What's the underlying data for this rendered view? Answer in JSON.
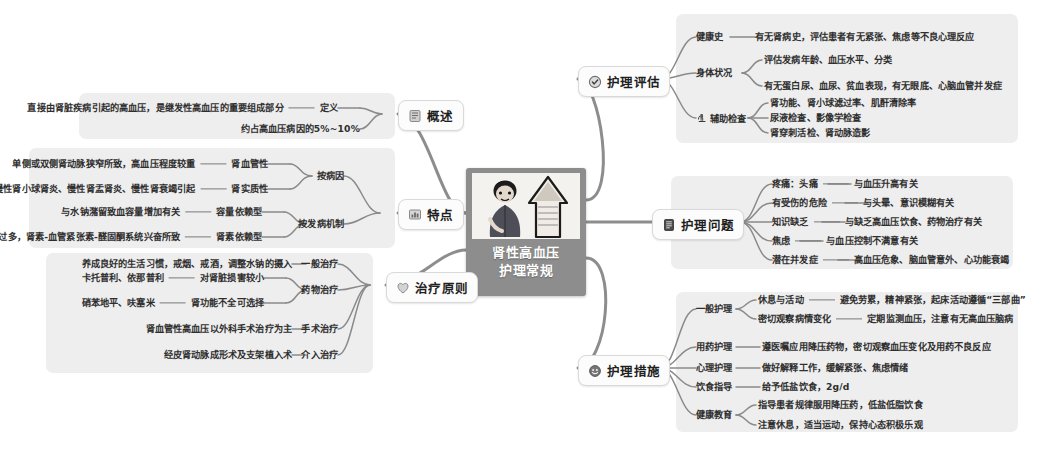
{
  "meta": {
    "root_title_line1": "肾性高血压",
    "root_title_line2": "护理常规",
    "bg_color": "#ffffff",
    "panel_color": "#eeeeee",
    "root_color": "#8d8d8d"
  },
  "branches": {
    "gaishu": {
      "label": "概述",
      "icon": "book-icon",
      "items": [
        {
          "key": "定义",
          "detail": "直接由肾脏疾病引起的高血压，是继发性高血压的重要组成部分"
        },
        {
          "key": "约占高血压病因的5%~10%",
          "detail": ""
        }
      ]
    },
    "tedian": {
      "label": "特点",
      "icon": "chart-icon",
      "groups": [
        {
          "key": "按病因",
          "items": [
            {
              "key": "肾血管性",
              "detail": "单侧或双侧肾动脉狭窄所致，高血压程度较重"
            },
            {
              "key": "肾实质性",
              "detail": "急性或慢性肾小球肾炎、慢性肾盂肾炎、慢性肾衰竭引起"
            }
          ]
        },
        {
          "key": "按发病机制",
          "items": [
            {
              "key": "容量依赖型",
              "detail": "与水钠潴留致血容量增加有关"
            },
            {
              "key": "肾素依赖型",
              "detail": "肾素分泌过多，肾素-血管紧张素-醛固酮系统兴奋所致"
            }
          ]
        }
      ]
    },
    "zhiliao": {
      "label": "治疗原则",
      "icon": "heart-icon",
      "groups": [
        {
          "key": "一般治疗",
          "items": [
            {
              "key": "",
              "detail": "养成良好的生活习惯，戒烟、戒酒，调整水钠的摄入"
            }
          ]
        },
        {
          "key": "药物治疗",
          "items": [
            {
              "key": "卡托普利、依那普利",
              "detail": "对肾脏损害较小"
            },
            {
              "key": "硝苯地平、呋塞米",
              "detail": "肾功能不全可选择"
            }
          ]
        },
        {
          "key": "手术治疗",
          "items": [
            {
              "key": "",
              "detail": "肾血管性高血压以外科手术治疗为主"
            }
          ]
        },
        {
          "key": "介入治疗",
          "items": [
            {
              "key": "",
              "detail": "经皮肾动脉成形术及支架植入术"
            }
          ]
        }
      ]
    },
    "pinggu": {
      "label": "护理评估",
      "icon": "check-circle-icon",
      "groups": [
        {
          "key": "健康史",
          "icon": "",
          "items": [
            {
              "detail": "有无肾病史，评估患者有无紧张、焦虑等不良心理反应"
            }
          ]
        },
        {
          "key": "身体状况",
          "icon": "",
          "items": [
            {
              "detail": "评估发病年龄、血压水平、分类"
            },
            {
              "detail": "有无蛋白尿、血尿、贫血表现，有无眼底、心脑血管并发症"
            }
          ]
        },
        {
          "key": "辅助检查",
          "icon": "microscope-icon",
          "items": [
            {
              "detail": "肾功能、肾小球滤过率、肌酐清除率"
            },
            {
              "detail": "尿液检查、影像学检查"
            },
            {
              "detail": "肾穿刺活检、肾动脉造影"
            }
          ]
        }
      ]
    },
    "wenti": {
      "label": "护理问题",
      "icon": "clipboard-icon",
      "items": [
        {
          "key": "疼痛：头痛",
          "detail": "与血压升高有关"
        },
        {
          "key": "有受伤的危险",
          "detail": "与头晕、意识模糊有关"
        },
        {
          "key": "知识缺乏",
          "detail": "与缺乏高血压饮食、药物治疗有关"
        },
        {
          "key": "焦虑",
          "detail": "与血压控制不满意有关"
        },
        {
          "key": "潜在并发症",
          "detail": "高血压危象、脑血管意外、心功能衰竭"
        }
      ]
    },
    "cuoshi": {
      "label": "护理措施",
      "icon": "smiley-icon",
      "groups": [
        {
          "key": "一般护理",
          "items": [
            {
              "key": "休息与活动",
              "detail": "避免劳累，精神紧张，起床活动遵循“三部曲”"
            },
            {
              "key": "密切观察病情变化",
              "detail": "定期监测血压，注意有无高血压脑病"
            }
          ]
        },
        {
          "key": "用药护理",
          "items": [
            {
              "key": "",
              "detail": "遵医嘱应用降压药物，密切观察血压变化及用药不良反应"
            }
          ]
        },
        {
          "key": "心理护理",
          "items": [
            {
              "key": "",
              "detail": "做好解释工作，缓解紧张、焦虑情绪"
            }
          ]
        },
        {
          "key": "饮食指导",
          "items": [
            {
              "key": "",
              "detail": "给予低盐饮食，2g/d"
            }
          ]
        },
        {
          "key": "健康教育",
          "items": [
            {
              "key": "",
              "detail": "指导患者规律服用降压药，低盐低脂饮食"
            },
            {
              "key": "",
              "detail": "注意休息，适当运动，保持心态积极乐观"
            }
          ]
        }
      ]
    }
  }
}
